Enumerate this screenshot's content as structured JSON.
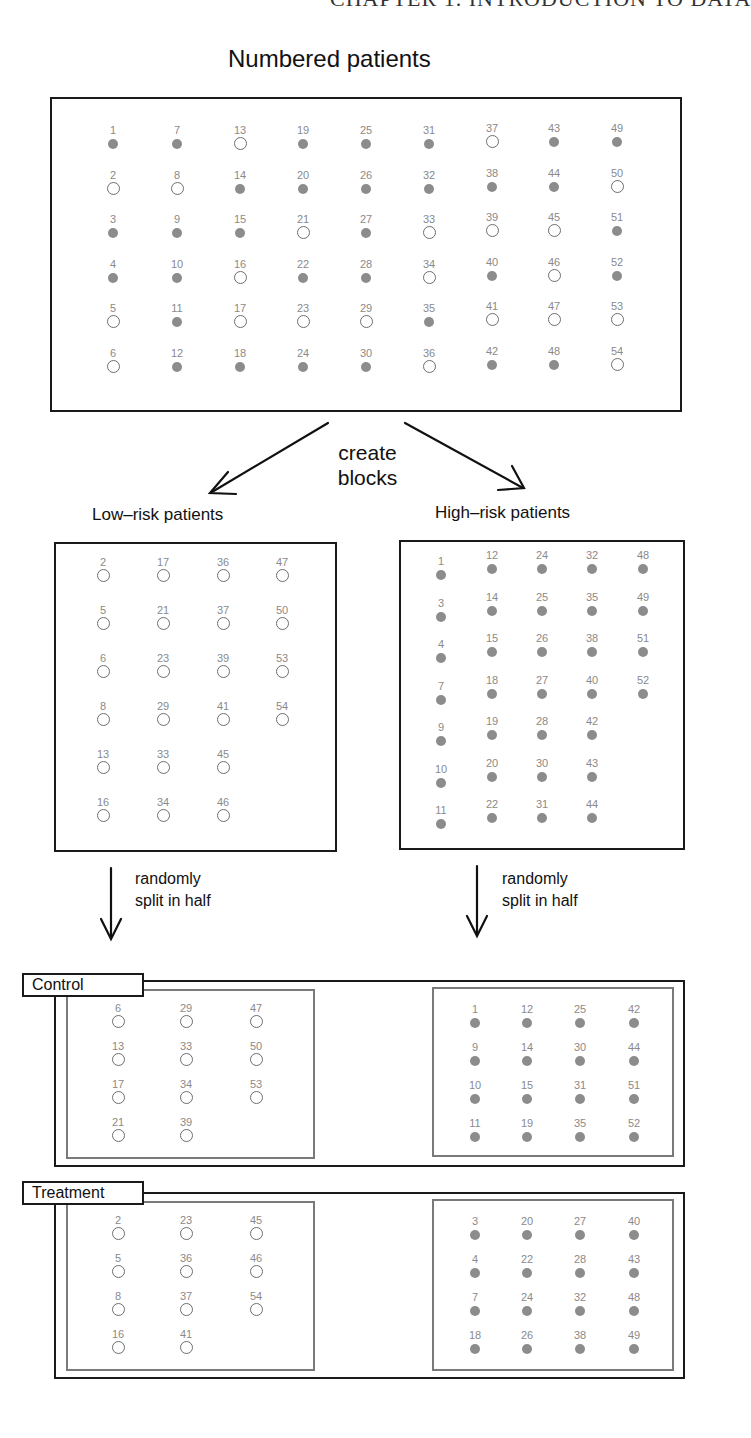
{
  "header_cut": "CHAPTER 1.  INTRODUCTION TO DATA",
  "colors": {
    "filled": "#8c8c8c",
    "open_stroke": "#6e6e6e",
    "label_text": "#8a8a8a",
    "box_border": "#1a1a1a",
    "inner_border": "#7a7a7a"
  },
  "legend_semantics": {
    "filled": "high-risk",
    "open": "low-risk"
  },
  "numbered": {
    "title": "Numbered patients",
    "columns": [
      [
        {
          "n": "1",
          "t": "f"
        },
        {
          "n": "2",
          "t": "o"
        },
        {
          "n": "3",
          "t": "f"
        },
        {
          "n": "4",
          "t": "f"
        },
        {
          "n": "5",
          "t": "o"
        },
        {
          "n": "6",
          "t": "o"
        }
      ],
      [
        {
          "n": "7",
          "t": "f"
        },
        {
          "n": "8",
          "t": "o"
        },
        {
          "n": "9",
          "t": "f"
        },
        {
          "n": "10",
          "t": "f"
        },
        {
          "n": "11",
          "t": "f"
        },
        {
          "n": "12",
          "t": "f"
        }
      ],
      [
        {
          "n": "13",
          "t": "o"
        },
        {
          "n": "14",
          "t": "f"
        },
        {
          "n": "15",
          "t": "f"
        },
        {
          "n": "16",
          "t": "o"
        },
        {
          "n": "17",
          "t": "o"
        },
        {
          "n": "18",
          "t": "f"
        }
      ],
      [
        {
          "n": "19",
          "t": "f"
        },
        {
          "n": "20",
          "t": "f"
        },
        {
          "n": "21",
          "t": "o"
        },
        {
          "n": "22",
          "t": "f"
        },
        {
          "n": "23",
          "t": "o"
        },
        {
          "n": "24",
          "t": "f"
        }
      ],
      [
        {
          "n": "25",
          "t": "f"
        },
        {
          "n": "26",
          "t": "f"
        },
        {
          "n": "27",
          "t": "f"
        },
        {
          "n": "28",
          "t": "f"
        },
        {
          "n": "29",
          "t": "o"
        },
        {
          "n": "30",
          "t": "f"
        }
      ],
      [
        {
          "n": "31",
          "t": "f"
        },
        {
          "n": "32",
          "t": "f"
        },
        {
          "n": "33",
          "t": "o"
        },
        {
          "n": "34",
          "t": "o"
        },
        {
          "n": "35",
          "t": "f"
        },
        {
          "n": "36",
          "t": "o"
        }
      ],
      [
        {
          "n": "37",
          "t": "o"
        },
        {
          "n": "38",
          "t": "f"
        },
        {
          "n": "39",
          "t": "o"
        },
        {
          "n": "40",
          "t": "f"
        },
        {
          "n": "41",
          "t": "o"
        },
        {
          "n": "42",
          "t": "f"
        }
      ],
      [
        {
          "n": "43",
          "t": "f"
        },
        {
          "n": "44",
          "t": "f"
        },
        {
          "n": "45",
          "t": "o"
        },
        {
          "n": "46",
          "t": "o"
        },
        {
          "n": "47",
          "t": "o"
        },
        {
          "n": "48",
          "t": "f"
        }
      ],
      [
        {
          "n": "49",
          "t": "f"
        },
        {
          "n": "50",
          "t": "o"
        },
        {
          "n": "51",
          "t": "f"
        },
        {
          "n": "52",
          "t": "f"
        },
        {
          "n": "53",
          "t": "o"
        },
        {
          "n": "54",
          "t": "o"
        }
      ]
    ]
  },
  "create_blocks": {
    "line1": "create",
    "line2": "blocks"
  },
  "low_risk": {
    "title": "Low–risk patients",
    "columns": [
      [
        "2",
        "5",
        "6",
        "8",
        "13",
        "16"
      ],
      [
        "17",
        "21",
        "23",
        "29",
        "33",
        "34"
      ],
      [
        "36",
        "37",
        "39",
        "41",
        "45",
        "46"
      ],
      [
        "47",
        "50",
        "53",
        "54"
      ]
    ]
  },
  "high_risk": {
    "title": "High–risk patients",
    "columns": [
      [
        "1",
        "3",
        "4",
        "7",
        "9",
        "10",
        "11"
      ],
      [
        "12",
        "14",
        "15",
        "18",
        "19",
        "20",
        "22"
      ],
      [
        "24",
        "25",
        "26",
        "27",
        "28",
        "30",
        "31"
      ],
      [
        "32",
        "35",
        "38",
        "40",
        "42",
        "43",
        "44"
      ],
      [
        "48",
        "49",
        "51",
        "52"
      ]
    ]
  },
  "split_note": {
    "line1": "randomly",
    "line2": "split in half"
  },
  "control": {
    "label": "Control",
    "low_columns": [
      [
        "6",
        "13",
        "17",
        "21"
      ],
      [
        "29",
        "33",
        "34",
        "39"
      ],
      [
        "47",
        "50",
        "53"
      ]
    ],
    "high_columns": [
      [
        "1",
        "9",
        "10",
        "11"
      ],
      [
        "12",
        "14",
        "15",
        "19"
      ],
      [
        "25",
        "30",
        "31",
        "35"
      ],
      [
        "42",
        "44",
        "51",
        "52"
      ]
    ]
  },
  "treatment": {
    "label": "Treatment",
    "low_columns": [
      [
        "2",
        "5",
        "8",
        "16"
      ],
      [
        "23",
        "36",
        "37",
        "41"
      ],
      [
        "45",
        "46",
        "54"
      ]
    ],
    "high_columns": [
      [
        "3",
        "4",
        "7",
        "18"
      ],
      [
        "20",
        "22",
        "24",
        "26"
      ],
      [
        "27",
        "28",
        "32",
        "38"
      ],
      [
        "40",
        "43",
        "48",
        "49"
      ]
    ]
  }
}
